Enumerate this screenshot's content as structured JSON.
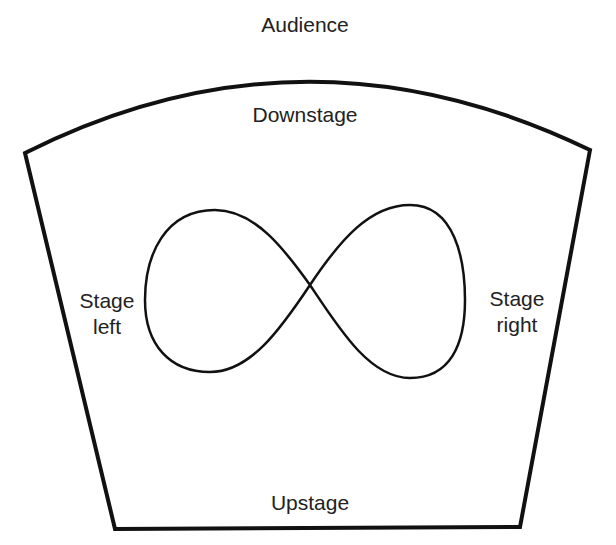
{
  "diagram": {
    "labels": {
      "audience": "Audience",
      "downstage": "Downstage",
      "upstage": "Upstage",
      "stage_left_line1": "Stage",
      "stage_left_line2": "left",
      "stage_right_line1": "Stage",
      "stage_right_line2": "right"
    },
    "shapes": {
      "stage_outline": "curved-top trapezoid",
      "movement_path": "figure-eight (infinity) loop"
    },
    "colors": {
      "line": "#111111",
      "text": "#222222",
      "background": "#ffffff"
    }
  }
}
